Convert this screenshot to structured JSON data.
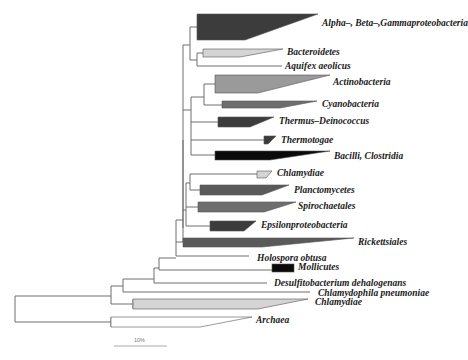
{
  "figure": {
    "type": "phylogenetic-tree",
    "scale_bar_label": "10%"
  },
  "colors": {
    "black": "#0a0a0a",
    "dark": "#3c3c3c",
    "mid_dark": "#5a5a5a",
    "mid": "#6e6e6e",
    "mid_light": "#9a9a9a",
    "light": "#d4d4d4",
    "branch": "#6e6e6e"
  },
  "taxa": [
    {
      "id": "alpha-beta-gamma",
      "label": "Alpha–, Beta–,Gammaproteobacteria",
      "kind": "clade",
      "shade": "dark"
    },
    {
      "id": "bacteroidetes",
      "label": "Bacteroidetes",
      "kind": "clade",
      "shade": "light"
    },
    {
      "id": "aquifex",
      "label": "Aquifex aeolicus",
      "kind": "leaf"
    },
    {
      "id": "actinobacteria",
      "label": "Actinobacteria",
      "kind": "clade",
      "shade": "mid_light"
    },
    {
      "id": "cyanobacteria",
      "label": "Cyanobacteria",
      "kind": "clade",
      "shade": "mid"
    },
    {
      "id": "thermus",
      "label": "Thermus–Deinococcus",
      "kind": "clade",
      "shade": "dark"
    },
    {
      "id": "thermotogae",
      "label": "Thermotogae",
      "kind": "clade",
      "shade": "dark"
    },
    {
      "id": "bacilli",
      "label": "Bacilli, Clostridia",
      "kind": "clade",
      "shade": "black"
    },
    {
      "id": "chlamydiae-upper",
      "label": "Chlamydiae",
      "kind": "clade",
      "shade": "light"
    },
    {
      "id": "planctomycetes",
      "label": "Planctomycetes",
      "kind": "clade",
      "shade": "mid_dark"
    },
    {
      "id": "spirochaetales",
      "label": "Spirochaetales",
      "kind": "clade",
      "shade": "mid"
    },
    {
      "id": "epsilon",
      "label": "Epsilonproteobacteria",
      "kind": "clade",
      "shade": "dark"
    },
    {
      "id": "rickettsiales",
      "label": "Rickettsiales",
      "kind": "clade",
      "shade": "mid_dark"
    },
    {
      "id": "holospora",
      "label": "Holospora obtusa",
      "kind": "leaf"
    },
    {
      "id": "mollicutes",
      "label": "Mollicutes",
      "kind": "clade",
      "shade": "black"
    },
    {
      "id": "desulfito",
      "label": "Desulfitobacterium dehalogenans",
      "kind": "leaf"
    },
    {
      "id": "chlamydophila",
      "label": "Chlamydophila pneumoniae",
      "kind": "leaf"
    },
    {
      "id": "chlamydiae-lower",
      "label": "Chlamydiae",
      "kind": "clade",
      "shade": "light"
    },
    {
      "id": "archaea",
      "label": "Archaea",
      "kind": "clade",
      "shade": "white"
    }
  ]
}
